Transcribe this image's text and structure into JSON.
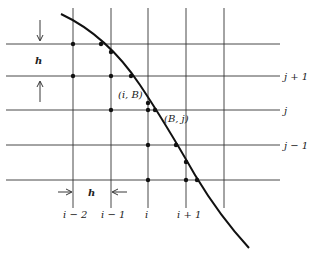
{
  "diagram": {
    "grid": {
      "vertical_x": [
        73,
        111,
        148,
        186,
        224
      ],
      "horizontal_y": [
        44,
        76,
        110,
        145,
        180
      ],
      "x_extent": [
        6,
        260
      ],
      "y_extent": [
        8,
        208
      ]
    },
    "column_labels": [
      {
        "text": "i − 2",
        "x": 73
      },
      {
        "text": "i − 1",
        "x": 111
      },
      {
        "text": "i",
        "x": 148
      },
      {
        "text": "i + 1",
        "x": 186
      }
    ],
    "row_labels": [
      {
        "text": "j + 1",
        "y": 76
      },
      {
        "text": "j",
        "y": 110
      },
      {
        "text": "j − 1",
        "y": 145
      }
    ],
    "point_labels": {
      "iB": "(i, B)",
      "Bj": "(B, j)"
    },
    "spacing_labels": {
      "vertical_h": "h",
      "horizontal_h": "h"
    },
    "curve_color": "#111111",
    "grid_color": "#333333"
  }
}
